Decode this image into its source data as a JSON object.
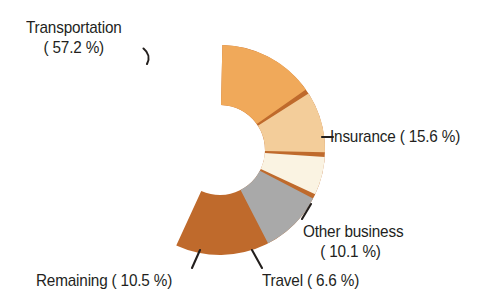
{
  "background_color": "#ffffff",
  "text_color": "#231f1d",
  "chart_data": {
    "type": "pie",
    "variant": "donut",
    "title": "",
    "subtitle": "",
    "xlabel": "",
    "ylabel": "",
    "legend_position": "none",
    "labels_position": "outside-with-leader-lines",
    "grid": false,
    "units": "%",
    "center": {
      "x": 220,
      "y": 150
    },
    "outer_radius": 105,
    "inner_radius": 45,
    "gap_degrees": 2.6,
    "start_angle_degrees": -90,
    "direction": "clockwise",
    "categories": [
      "Transportation",
      "Insurance",
      "Other business",
      "Travel",
      "Remaining"
    ],
    "values": [
      57.2,
      15.6,
      10.1,
      6.6,
      10.5
    ],
    "colors": [
      "#bf6a2c",
      "#f0a95a",
      "#f3cd9a",
      "#faf3e2",
      "#a9a9a9"
    ],
    "slices": [
      {
        "name": "Transportation",
        "value": 57.2,
        "value_text": "57.2",
        "color": "#bf6a2c",
        "start_angle": -90,
        "end_angle": 115.92
      },
      {
        "name": "Insurance",
        "value": 15.6,
        "value_text": "15.6",
        "color": "#f0a95a",
        "start_angle": -90,
        "end_angle": -33.84
      },
      {
        "name": "Other business",
        "value": 10.1,
        "value_text": "10.1",
        "color": "#f3cd9a",
        "start_angle": -33.84,
        "end_angle": 2.52
      },
      {
        "name": "Travel",
        "value": 6.6,
        "value_text": "6.6",
        "color": "#faf3e2",
        "start_angle": 2.52,
        "end_angle": 26.28
      },
      {
        "name": "Remaining",
        "value": 10.5,
        "value_text": "10.5",
        "color": "#a9a9a9",
        "start_angle": 26.28,
        "end_angle": 64.08
      }
    ]
  },
  "labels": {
    "transportation": {
      "line1": "Transportation",
      "line2": "( 57.2 %)"
    },
    "insurance": {
      "text": "Insurance ( 15.6 %)",
      "dash": "–"
    },
    "other_business": {
      "line1": "Other business",
      "line2": "( 10.1 %)"
    },
    "travel": {
      "text": "Travel (  6.6 %)"
    },
    "remaining": {
      "text": "Remaining ( 10.5 %)"
    }
  }
}
